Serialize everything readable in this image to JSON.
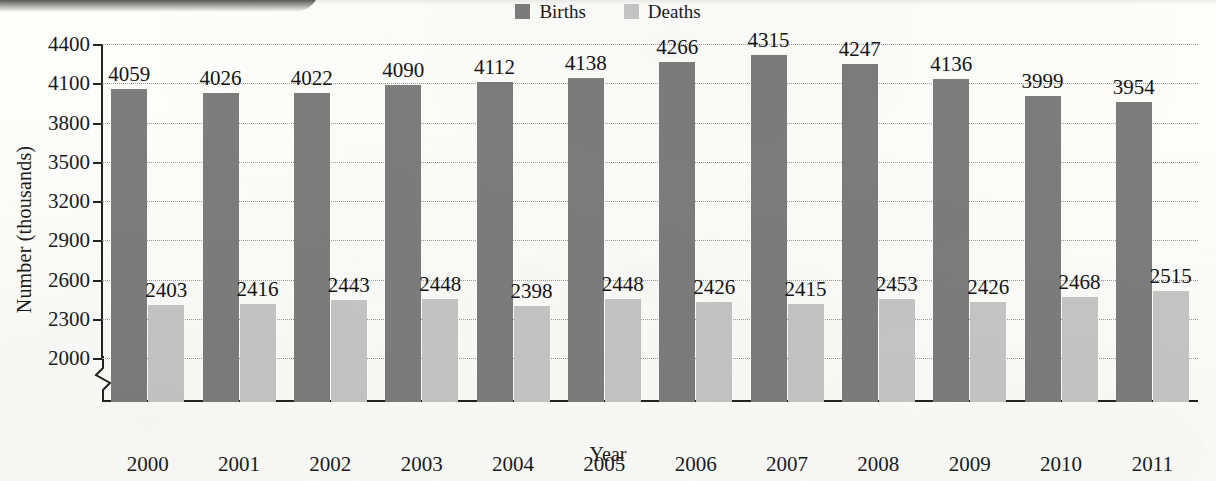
{
  "chart_data": {
    "type": "bar",
    "title": "",
    "xlabel": "Year",
    "ylabel": "Number (thousands)",
    "categories": [
      "2000",
      "2001",
      "2002",
      "2003",
      "2004",
      "2005",
      "2006",
      "2007",
      "2008",
      "2009",
      "2010",
      "2011"
    ],
    "series": [
      {
        "name": "Births",
        "color": "#7d7d7d",
        "values": [
          4059,
          4026,
          4022,
          4090,
          4112,
          4138,
          4266,
          4315,
          4247,
          4136,
          3999,
          3954
        ]
      },
      {
        "name": "Deaths",
        "color": "#c6c6c6",
        "values": [
          2403,
          2416,
          2443,
          2448,
          2398,
          2448,
          2426,
          2415,
          2453,
          2426,
          2468,
          2515
        ]
      }
    ],
    "ylim": [
      2000,
      4400
    ],
    "y_ticks": [
      2000,
      2300,
      2600,
      2900,
      3200,
      3500,
      3800,
      4100,
      4400
    ],
    "y_tick_labels": [
      "2000",
      "2300",
      "2600",
      "2900",
      "3200",
      "3500",
      "3800",
      "4100",
      "4400"
    ],
    "grid": true,
    "grid_style": "dotted",
    "axis_break": true,
    "legend_position": "top-center",
    "data_labels": true
  },
  "legend": {
    "entries": [
      {
        "label": "Births",
        "color": "#7d7d7d",
        "icon": "legend-swatch-births"
      },
      {
        "label": "Deaths",
        "color": "#c6c6c6",
        "icon": "legend-swatch-deaths"
      }
    ]
  },
  "axes": {
    "y_title": "Number (thousands)",
    "x_title": "Year"
  }
}
